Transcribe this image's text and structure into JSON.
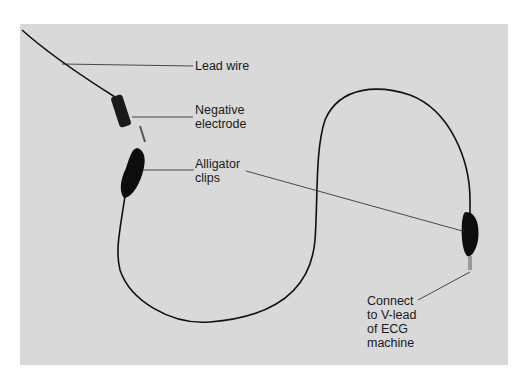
{
  "figure": {
    "labels": {
      "lead_wire": "Lead wire",
      "negative_electrode_1": "Negative",
      "negative_electrode_2": "electrode",
      "alligator_clips_1": "Alligator",
      "alligator_clips_2": "clips",
      "connect_1": "Connect",
      "connect_2": "to V-lead",
      "connect_3": "of ECG",
      "connect_4": "machine"
    }
  }
}
